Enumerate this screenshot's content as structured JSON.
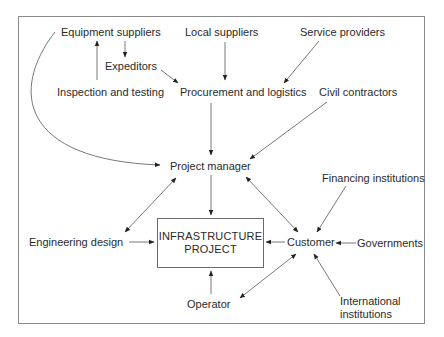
{
  "diagram": {
    "type": "flow",
    "central": {
      "line1": "INFRASTRUCTURE",
      "line2": "PROJECT"
    },
    "nodes": {
      "equipment_suppliers": "Equipment suppliers",
      "local_suppliers": "Local suppliers",
      "service_providers": "Service providers",
      "expeditors": "Expeditors",
      "inspection_testing": "Inspection and testing",
      "procurement_logistics": "Procurement and logistics",
      "civil_contractors": "Civil contractors",
      "project_manager": "Project manager",
      "financing_institutions": "Financing institutions",
      "engineering_design": "Engineering design",
      "customer": "Customer",
      "governments": "Governments",
      "operator": "Operator",
      "international_line1": "International",
      "international_line2": "institutions"
    },
    "edges": [
      {
        "from": "Equipment suppliers",
        "to": "Expeditors",
        "direction": "one-way"
      },
      {
        "from": "Inspection and testing",
        "to": "Equipment suppliers",
        "direction": "one-way"
      },
      {
        "from": "Expeditors",
        "to": "Procurement and logistics",
        "direction": "one-way"
      },
      {
        "from": "Local suppliers",
        "to": "Procurement and logistics",
        "direction": "one-way"
      },
      {
        "from": "Service providers",
        "to": "Procurement and logistics",
        "direction": "one-way"
      },
      {
        "from": "Equipment suppliers",
        "to": "Project manager",
        "direction": "one-way"
      },
      {
        "from": "Procurement and logistics",
        "to": "Project manager",
        "direction": "one-way"
      },
      {
        "from": "Civil contractors",
        "to": "Project manager",
        "direction": "one-way"
      },
      {
        "from": "Project manager",
        "to": "INFRASTRUCTURE PROJECT",
        "direction": "one-way"
      },
      {
        "from": "Project manager",
        "to": "Engineering design",
        "direction": "two-way"
      },
      {
        "from": "Project manager",
        "to": "Customer",
        "direction": "two-way"
      },
      {
        "from": "Engineering design",
        "to": "INFRASTRUCTURE PROJECT",
        "direction": "one-way"
      },
      {
        "from": "Customer",
        "to": "INFRASTRUCTURE PROJECT",
        "direction": "one-way"
      },
      {
        "from": "Operator",
        "to": "INFRASTRUCTURE PROJECT",
        "direction": "one-way"
      },
      {
        "from": "Operator",
        "to": "Customer",
        "direction": "two-way"
      },
      {
        "from": "Financing institutions",
        "to": "Customer",
        "direction": "one-way"
      },
      {
        "from": "Governments",
        "to": "Customer",
        "direction": "one-way"
      },
      {
        "from": "International institutions",
        "to": "Customer",
        "direction": "one-way"
      }
    ]
  }
}
